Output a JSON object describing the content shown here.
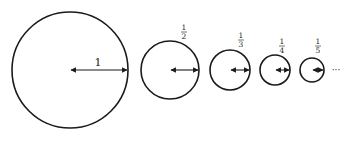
{
  "diagram": {
    "title": "",
    "circles": [
      {
        "cx": 70,
        "cy": 70,
        "r": 58,
        "label_num": "1",
        "label_den": "",
        "label": "1"
      },
      {
        "cx": 170,
        "cy": 70,
        "r": 29,
        "label_num": "1",
        "label_den": "2",
        "label": "1/2"
      },
      {
        "cx": 230,
        "cy": 70,
        "r": 20,
        "label_num": "1",
        "label_den": "3",
        "label": "1/3"
      },
      {
        "cx": 275,
        "cy": 70,
        "r": 15,
        "label_num": "1",
        "label_den": "4",
        "label": "1/4"
      },
      {
        "cx": 312,
        "cy": 70,
        "r": 12,
        "label_num": "1",
        "label_den": "5",
        "label": "1/5"
      }
    ],
    "ellipsis": "···",
    "stroke_color": "#1a1a1a"
  }
}
